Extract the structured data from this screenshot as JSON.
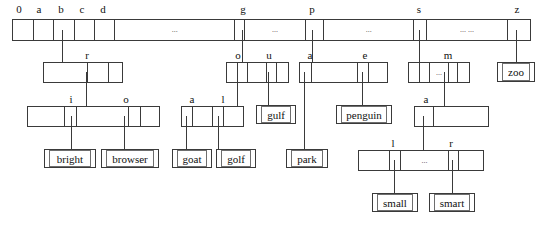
{
  "figure": {
    "type": "trie-index-diagram",
    "title": "",
    "line_color": "#3a3a3a",
    "background": "#ffffff"
  },
  "root": {
    "name": "root-node",
    "labels": [
      "0",
      "a",
      "b",
      "c",
      "d",
      "g",
      "p",
      "s",
      "z"
    ],
    "cells": [
      {
        "text": ""
      },
      {
        "text": ""
      },
      {
        "text": ""
      },
      {
        "text": ""
      },
      {
        "text": ""
      },
      {
        "text": "..."
      },
      {
        "text": ""
      },
      {
        "text": "..."
      },
      {
        "text": ""
      },
      {
        "text": "..."
      },
      {
        "text": ""
      },
      {
        "text": "... ..."
      },
      {
        "text": ""
      }
    ]
  },
  "nodes": {
    "b_node": {
      "name": "node-b",
      "labels": [
        "r"
      ],
      "cells": [
        "",
        "",
        ""
      ]
    },
    "br_node": {
      "name": "node-br",
      "labels": [
        "i",
        "o"
      ],
      "cells": [
        "",
        "",
        "",
        "",
        ""
      ]
    },
    "g_node": {
      "name": "node-g",
      "labels": [
        "o",
        "u"
      ],
      "cells": [
        "",
        "",
        "",
        "",
        ""
      ]
    },
    "go_node": {
      "name": "node-go",
      "labels": [
        "a",
        "l"
      ],
      "cells": [
        "",
        "",
        "",
        ""
      ]
    },
    "p_node": {
      "name": "node-p",
      "labels": [
        "a",
        "e"
      ],
      "cells": [
        "",
        "",
        "",
        ""
      ]
    },
    "s_node": {
      "name": "node-s",
      "labels": [
        "m"
      ],
      "cells": [
        "",
        "",
        "...",
        "",
        ""
      ]
    },
    "sm_node": {
      "name": "node-sm",
      "labels": [
        "a"
      ],
      "cells": [
        "",
        ""
      ]
    },
    "sma_node": {
      "name": "node-sma",
      "labels": [
        "l",
        "r"
      ],
      "cells": [
        "",
        "",
        "...",
        "",
        ""
      ]
    }
  },
  "leaves": [
    {
      "name": "leaf-bright",
      "text": "bright"
    },
    {
      "name": "leaf-browser",
      "text": "browser"
    },
    {
      "name": "leaf-goat",
      "text": "goat"
    },
    {
      "name": "leaf-golf",
      "text": "golf"
    },
    {
      "name": "leaf-gulf",
      "text": "gulf"
    },
    {
      "name": "leaf-park",
      "text": "park"
    },
    {
      "name": "leaf-penguin",
      "text": "penguin"
    },
    {
      "name": "leaf-small",
      "text": "small"
    },
    {
      "name": "leaf-smart",
      "text": "smart"
    },
    {
      "name": "leaf-zoo",
      "text": "zoo"
    }
  ],
  "key_labels": {
    "root": {
      "l0": "0",
      "l1": "a",
      "l2": "b",
      "l3": "c",
      "l4": "d",
      "l5": "g",
      "l6": "p",
      "l7": "s",
      "l8": "z"
    },
    "b": {
      "r": "r"
    },
    "br": {
      "i": "i",
      "o": "o"
    },
    "g": {
      "o": "o",
      "u": "u"
    },
    "go": {
      "a": "a",
      "l": "l"
    },
    "p": {
      "a": "a",
      "e": "e"
    },
    "s": {
      "m": "m"
    },
    "sm": {
      "a": "a"
    },
    "sma": {
      "l": "l",
      "r": "r"
    }
  },
  "ellipsis": {
    "root_1": "...",
    "root_2": "...",
    "root_3": "...",
    "root_4": "... ...",
    "s_mid": "...",
    "sma_mid": "..."
  }
}
